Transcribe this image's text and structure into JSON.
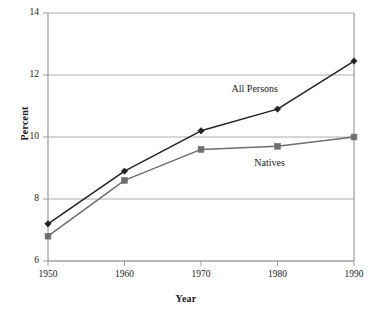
{
  "chart_data": {
    "type": "line",
    "title": "",
    "xlabel": "Year",
    "ylabel": "Percent",
    "x": [
      1950,
      1960,
      1970,
      1980,
      1990
    ],
    "xtick_labels": [
      "1950",
      "1960",
      "1970",
      "1980",
      "1990"
    ],
    "ytick_labels": [
      "6",
      "8",
      "10",
      "12",
      "14"
    ],
    "yticks": [
      6,
      8,
      10,
      12,
      14
    ],
    "xlim": [
      1950,
      1990
    ],
    "ylim": [
      6,
      14
    ],
    "grid": "horizontal",
    "legend_position": "inline-annotations",
    "series": [
      {
        "name": "All Persons",
        "values": [
          7.2,
          8.9,
          10.2,
          10.9,
          12.45
        ],
        "color": "#222222",
        "marker": "diamond"
      },
      {
        "name": "Natives",
        "values": [
          6.8,
          8.6,
          9.6,
          9.7,
          10.0
        ],
        "color": "#6e6e6e",
        "marker": "square"
      }
    ],
    "annotations": [
      {
        "text": "All Persons",
        "x": 1977,
        "y": 11.55
      },
      {
        "text": "Natives",
        "x": 1979,
        "y": 9.15
      }
    ],
    "colors": {
      "all_persons": "#222222",
      "natives": "#6e6e6e",
      "grid": "#9a9a9a",
      "frame": "#9a9a9a",
      "text": "#1a1a1a",
      "background": "#ffffff"
    }
  }
}
